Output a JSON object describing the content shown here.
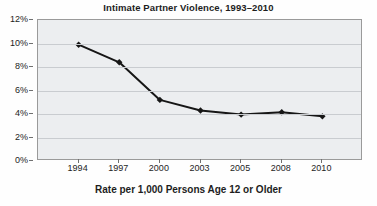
{
  "chart_data": {
    "type": "line",
    "title": "Intimate Partner Violence, 1993–2010",
    "xlabel": "Rate per 1,000 Persons Age 12 or Older",
    "ylabel": "",
    "categories": [
      "1994",
      "1997",
      "2000",
      "2003",
      "2005",
      "2008",
      "2010"
    ],
    "values": [
      9.9,
      8.4,
      5.2,
      4.3,
      3.95,
      4.15,
      3.8
    ],
    "series": [
      {
        "name": "Intimate Partner Violence Rate",
        "values": [
          9.9,
          8.4,
          5.2,
          4.3,
          3.95,
          4.15,
          3.8
        ]
      }
    ],
    "ylim": [
      0,
      12
    ],
    "ytick_labels": [
      "0%",
      "2%",
      "4%",
      "6%",
      "8%",
      "10%",
      "12%"
    ],
    "ytick_values": [
      0,
      2,
      4,
      6,
      8,
      10,
      12
    ],
    "grid": true,
    "legend": "none",
    "marker": "diamond",
    "line_color": "#161616",
    "marker_color": "#161616",
    "plot_background": "#eceef0",
    "gridline_color": "#c9ccd0",
    "axis_color": "#9a9a9a"
  }
}
